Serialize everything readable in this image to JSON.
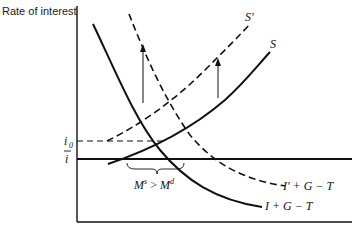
{
  "diagram": {
    "y_axis_label": "Rate of interest",
    "x_axis_label": "",
    "tick_labels": {
      "i0": "i",
      "i0_sub": "0",
      "ibar": "i"
    },
    "curves": {
      "S": "S",
      "S_prime": "S'",
      "IGT": "I + G − T",
      "IGT_prime": "I' + G − T"
    },
    "annotation": {
      "excess_supply": "M",
      "excess_supply_sup": "s",
      "gt": " > ",
      "excess_demand": "M",
      "excess_demand_sup": "d"
    },
    "colors": {
      "ink": "#111111",
      "background": "#ffffff"
    }
  }
}
